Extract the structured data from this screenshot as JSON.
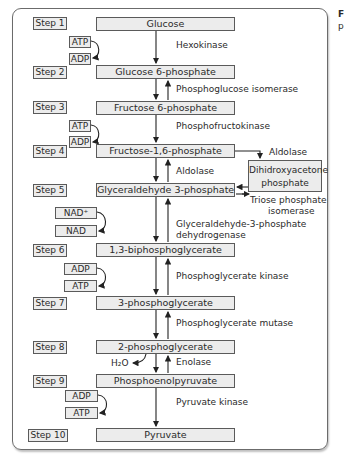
{
  "diagram": {
    "steps": [
      {
        "label": "Step 1",
        "metabolite": "Glucose"
      },
      {
        "label": "Step 2",
        "metabolite": "Glucose 6-phosphate"
      },
      {
        "label": "Step 3",
        "metabolite": "Fructose 6-phosphate"
      },
      {
        "label": "Step 4",
        "metabolite": "Fructose-1,6-phosphate"
      },
      {
        "label": "Step 5",
        "metabolite": "Glyceraldehyde 3-phosphate"
      },
      {
        "label": "Step 6",
        "metabolite": "1,3-biphosphoglycerate"
      },
      {
        "label": "Step 7",
        "metabolite": "3-phosphoglycerate"
      },
      {
        "label": "Step 8",
        "metabolite": "2-phosphoglycerate"
      },
      {
        "label": "Step 9",
        "metabolite": "Phosphoenolpyruvate"
      },
      {
        "label": "Step 10",
        "metabolite": "Pyruvate"
      }
    ],
    "enzymes": {
      "hexokinase": "Hexokinase",
      "pgi": "Phosphoglucose isomerase",
      "pfk": "Phosphofructokinase",
      "aldolase_side": "Aldolase",
      "aldolase_main": "Aldolase",
      "tpi_1": "Triose phosphate",
      "tpi_2": "isomerase",
      "gapdh_1": "Glyceraldehyde-3-phosphate",
      "gapdh_2": "dehydrogenase",
      "pgk": "Phosphoglycerate kinase",
      "pgm": "Phosphoglycerate mutase",
      "enolase": "Enolase",
      "pk": "Pyruvate kinase"
    },
    "side_product": {
      "line1": "Dihidroxyacetone",
      "line2": "phosphate"
    },
    "cofactors": {
      "s1_in": "ATP",
      "s1_out": "ADP",
      "s3_in": "ATP",
      "s3_out": "ADP",
      "s5_in": "NAD⁺",
      "s5_out": "NAD",
      "s6_in": "ADP",
      "s6_out": "ATP",
      "s8_out": "H₂O",
      "s9_in": "ADP",
      "s9_out": "ATP"
    }
  },
  "caption_fragment": {
    "line1": "F",
    "line2": "p"
  }
}
